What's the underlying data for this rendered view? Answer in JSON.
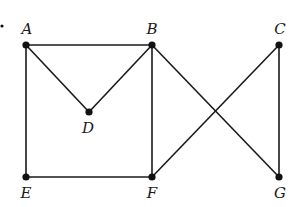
{
  "diagram": {
    "type": "graph",
    "marker_dot": {
      "x": 2,
      "y": 26
    },
    "nodes": [
      {
        "id": "A",
        "label": "A",
        "x": 26,
        "y": 45,
        "lx": 27,
        "ly": 34
      },
      {
        "id": "B",
        "label": "B",
        "x": 152,
        "y": 45,
        "lx": 152,
        "ly": 34
      },
      {
        "id": "C",
        "label": "C",
        "x": 279,
        "y": 45,
        "lx": 280,
        "ly": 34
      },
      {
        "id": "D",
        "label": "D",
        "x": 89,
        "y": 112,
        "lx": 88,
        "ly": 133
      },
      {
        "id": "E",
        "label": "E",
        "x": 26,
        "y": 177,
        "lx": 26,
        "ly": 198
      },
      {
        "id": "F",
        "label": "F",
        "x": 152,
        "y": 177,
        "lx": 152,
        "ly": 198
      },
      {
        "id": "G",
        "label": "G",
        "x": 279,
        "y": 177,
        "lx": 280,
        "ly": 198
      }
    ],
    "edges": [
      [
        "A",
        "B"
      ],
      [
        "A",
        "D"
      ],
      [
        "D",
        "B"
      ],
      [
        "A",
        "E"
      ],
      [
        "E",
        "F"
      ],
      [
        "B",
        "F"
      ],
      [
        "B",
        "G"
      ],
      [
        "C",
        "F"
      ],
      [
        "C",
        "G"
      ]
    ]
  }
}
